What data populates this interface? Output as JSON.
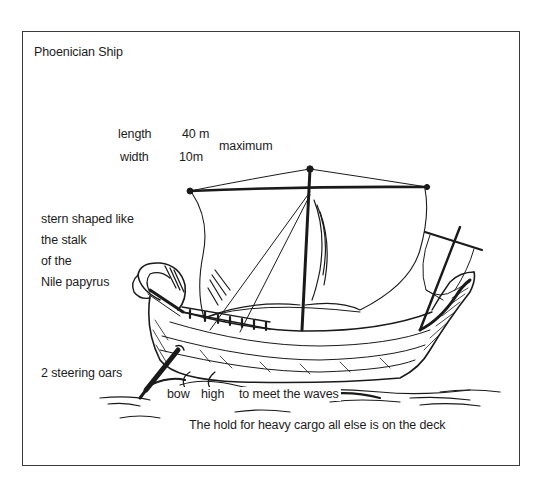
{
  "diagram": {
    "title": "Phoenician Ship",
    "dimensions": {
      "length_label": "length",
      "length_value": "40 m",
      "width_label": "width",
      "width_value": "10m",
      "qualifier": "maximum"
    },
    "annotations": {
      "stern_line1": "stern shaped like",
      "stern_line2": "the stalk",
      "stern_line3": "of the",
      "stern_line4": "Nile papyrus",
      "steering": "2 steering oars",
      "bow_word1": "bow",
      "bow_word2": "high",
      "bow_word3": "to meet the waves",
      "hold": "The hold for heavy cargo all else is on the deck"
    },
    "illustration": {
      "subject": "ship-drawing",
      "style": "pen-and-ink",
      "ink_color": "#1a1a1a",
      "background_color": "#ffffff"
    }
  }
}
